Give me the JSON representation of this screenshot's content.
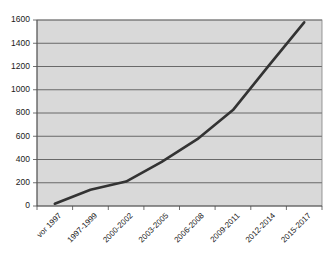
{
  "chart_data": {
    "type": "line",
    "title": "",
    "subtitle": "",
    "xlabel": "",
    "ylabel": "",
    "categories": [
      "vor 1997",
      "1997-1999",
      "2000-2002",
      "2003-2005",
      "2006-2008",
      "2009-2011",
      "2012-2014",
      "2015-2017"
    ],
    "values": [
      20,
      140,
      210,
      380,
      575,
      825,
      1205,
      1580
    ],
    "series": [
      {
        "name": "Anzahl",
        "values": [
          20,
          140,
          210,
          380,
          575,
          825,
          1205,
          1580
        ]
      }
    ],
    "ylim": [
      0,
      1600
    ],
    "ytick_labels": [
      "0",
      "200",
      "400",
      "600",
      "800",
      "1000",
      "1200",
      "1400",
      "1600"
    ],
    "ytick_values": [
      0,
      200,
      400,
      600,
      800,
      1000,
      1200,
      1400,
      1600
    ],
    "grid": true,
    "grid_axis": "y",
    "legend": false,
    "legend_position": "none",
    "annotations": [],
    "colors": {
      "series_line": "#333333",
      "plot_background": "#d9d9d9",
      "gridline": "#4d4d4d",
      "axis": "#4d4d4d",
      "page_background": "#ffffff",
      "tick_text": "#1a1a1a"
    },
    "xtick_label_rotation_degrees": -45
  }
}
